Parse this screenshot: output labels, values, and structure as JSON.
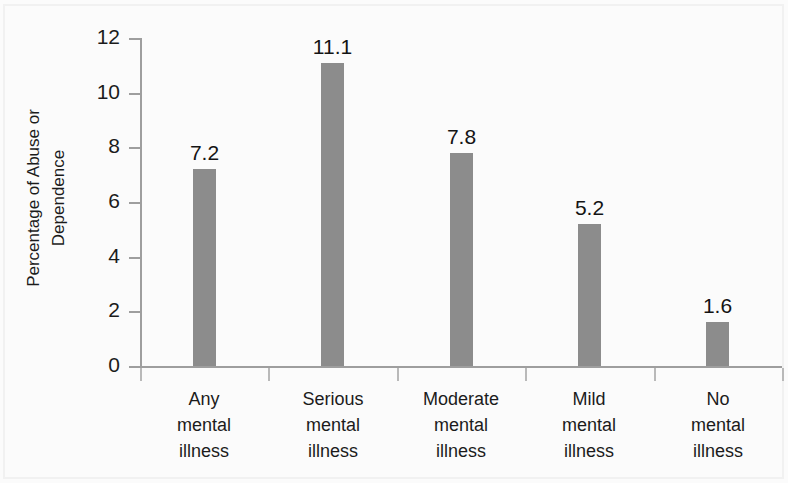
{
  "chart_data": {
    "type": "bar",
    "title": "",
    "subtitle": "",
    "xlabel": "",
    "ylabel": "Percentage of Abuse or Dependence",
    "ylabel_lines": [
      "Percentage of Abuse or",
      "Dependence"
    ],
    "categories": [
      "Any mental illness",
      "Serious mental illness",
      "Moderate mental illness",
      "Mild mental illness",
      "No mental illness"
    ],
    "category_lines": [
      [
        "Any",
        "mental",
        "illness"
      ],
      [
        "Serious",
        "mental",
        "illness"
      ],
      [
        "Moderate",
        "mental",
        "illness"
      ],
      [
        "Mild",
        "mental",
        "illness"
      ],
      [
        "No",
        "mental",
        "illness"
      ]
    ],
    "values": [
      7.2,
      11.1,
      7.8,
      5.2,
      1.6
    ],
    "value_labels": [
      "7.2",
      "11.1",
      "7.8",
      "5.2",
      "1.6"
    ],
    "ylim": [
      0,
      12
    ],
    "ytick_values": [
      0,
      2,
      4,
      6,
      8,
      10,
      12
    ],
    "ytick_labels": [
      "0",
      "2",
      "4",
      "6",
      "8",
      "10",
      "12"
    ],
    "grid": false,
    "legend": false,
    "legend_position": "none",
    "bar_color": "#8c8c8c",
    "axis_color": "#9e9e9e",
    "text_color": "#1b1b1b",
    "background_color": "#fbfbfb",
    "data_labels_shown": true
  }
}
